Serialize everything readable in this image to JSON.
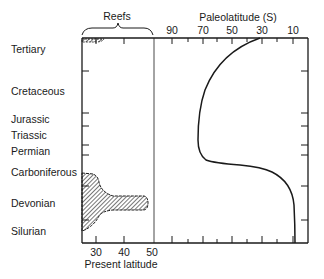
{
  "diagram": {
    "left_panel": {
      "title": "Reefs",
      "x_axis_label": "Present latitude",
      "x_ticks": [
        "30",
        "40",
        "50"
      ]
    },
    "right_panel": {
      "title": "Paleolatitude (S)",
      "x_ticks": [
        "90",
        "70",
        "50",
        "30",
        "10"
      ]
    },
    "periods": [
      {
        "name": "Tertiary",
        "y": 49
      },
      {
        "name": "Cretaceous",
        "y": 91
      },
      {
        "name": "Jurassic",
        "y": 119
      },
      {
        "name": "Triassic",
        "y": 135
      },
      {
        "name": "Permian",
        "y": 151
      },
      {
        "name": "Carboniferous",
        "y": 172
      },
      {
        "name": "Devonian",
        "y": 203
      },
      {
        "name": "Silurian",
        "y": 231
      }
    ],
    "colors": {
      "ink": "#1a1a1a",
      "background": "#ffffff"
    }
  }
}
